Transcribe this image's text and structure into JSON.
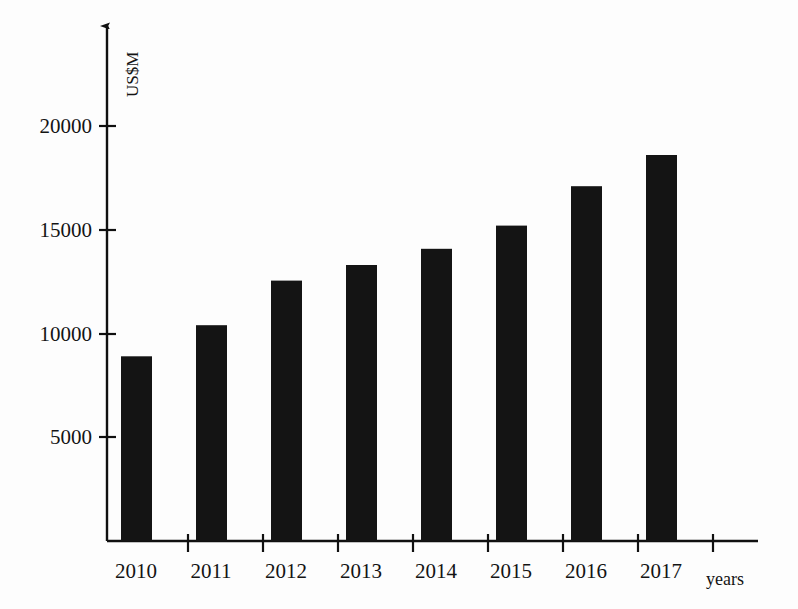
{
  "chart_data": {
    "type": "bar",
    "title": "",
    "xlabel": "years",
    "ylabel": "US$M",
    "categories": [
      "2010",
      "2011",
      "2012",
      "2013",
      "2014",
      "2015",
      "2016",
      "2017"
    ],
    "values": [
      8900,
      10400,
      12550,
      13300,
      14080,
      15200,
      17100,
      18600
    ],
    "ylim": [
      0,
      22000
    ],
    "yticks": [
      5000,
      10000,
      15000,
      20000
    ],
    "ytick_labels": [
      "5000",
      "10000",
      "15000",
      "20000"
    ],
    "grid": false,
    "legend": null,
    "series": [
      {
        "name": "US$M",
        "values": [
          8900,
          10400,
          12550,
          13300,
          14080,
          15200,
          17100,
          18600
        ],
        "color": "#141414"
      }
    ]
  },
  "axes": {
    "y_axis_label": "US$M",
    "x_axis_label": "years"
  },
  "colors": {
    "bar": "#141414",
    "axis": "#101010",
    "background": "#fdfdfd"
  }
}
